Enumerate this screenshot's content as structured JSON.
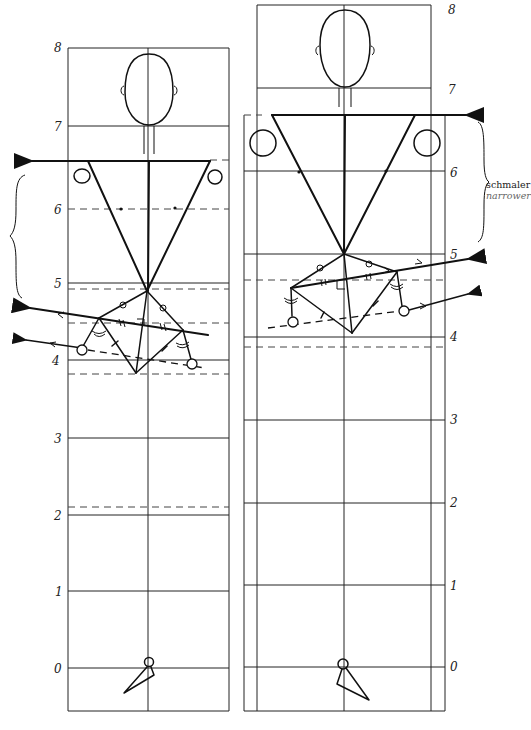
{
  "diagram": {
    "type": "figure-proportion-comparison",
    "scale_unit": "head heights",
    "figures": [
      {
        "id": "left",
        "description": "Figure with wider shoulders, pelvis below",
        "scale_labels": [
          "8",
          "7",
          "6",
          "5",
          "4",
          "3",
          "2",
          "1",
          "0"
        ],
        "shoulder_arrow_direction": "left",
        "hip_arrow_direction": "left"
      },
      {
        "id": "right",
        "description": "Figure with narrower shoulder region, pelvis higher",
        "scale_labels": [
          "8",
          "7",
          "6",
          "5",
          "4",
          "3",
          "2",
          "1",
          "0"
        ],
        "shoulder_arrow_direction": "right",
        "hip_arrow_direction": "right"
      }
    ],
    "annotation": {
      "primary": "schmaler",
      "secondary": "narrower"
    }
  },
  "left_scale": {
    "l8": "8",
    "l7": "7",
    "l6": "6",
    "l5": "5",
    "l4": "4",
    "l3": "3",
    "l2": "2",
    "l1": "1",
    "l0": "0"
  },
  "right_scale": {
    "l8": "8",
    "l7": "7",
    "l6": "6",
    "l5": "5",
    "l4": "4",
    "l3": "3",
    "l2": "2",
    "l1": "1",
    "l0": "0"
  },
  "colors": {
    "line": "#111111",
    "grid": "#222222",
    "dashed": "#444444",
    "annotation_secondary": "#666666"
  }
}
